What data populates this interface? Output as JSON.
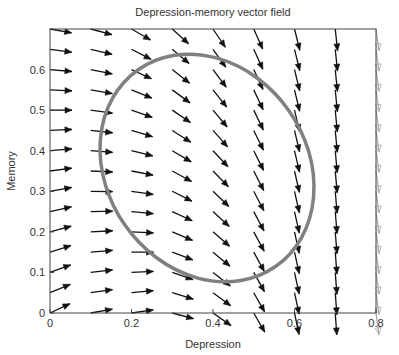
{
  "chart_data": {
    "type": "quiver",
    "title": "Depression-memory vector field",
    "xlabel": "Depression",
    "ylabel": "Memory",
    "xlim": [
      0,
      0.8
    ],
    "ylim": [
      0,
      0.7
    ],
    "xticks": [
      0,
      0.2,
      0.4,
      0.6,
      0.8
    ],
    "xtick_labels": [
      "0",
      "0.2",
      "0.4",
      "0.6",
      "0.8"
    ],
    "yticks": [
      0,
      0.1,
      0.2,
      0.3,
      0.4,
      0.5,
      0.6
    ],
    "ytick_labels": [
      "0",
      "0.1",
      "0.2",
      "0.3",
      "0.4",
      "0.5",
      "0.6"
    ],
    "grid": false,
    "vector_field": {
      "x": [
        0,
        0.1,
        0.2,
        0.3,
        0.4,
        0.5,
        0.6,
        0.7,
        0.8
      ],
      "y": [
        0,
        0.05,
        0.1,
        0.15,
        0.2,
        0.25,
        0.3,
        0.35,
        0.4,
        0.45,
        0.5,
        0.55,
        0.6,
        0.65,
        0.7
      ],
      "arrow_length_px": 22,
      "angle_deg_below_horizontal_bottom": [
        -25,
        -10,
        -8,
        15,
        35,
        60,
        78,
        86,
        82
      ],
      "angle_deg_below_horizontal_top": [
        10,
        15,
        30,
        42,
        56,
        66,
        76,
        84,
        82
      ],
      "arrow_color": "#111111",
      "clipped_column_color": "#aaaaaa"
    },
    "ellipse": {
      "center": [
        0.38,
        0.37
      ],
      "bbox_x": [
        0.13,
        0.64
      ],
      "bbox_y": [
        0.08,
        0.64
      ],
      "rotation_deg": 35,
      "stroke_color": "#808080",
      "stroke_width": 3.5
    }
  }
}
